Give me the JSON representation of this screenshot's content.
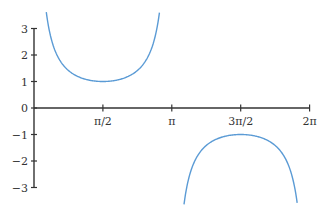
{
  "chart_data": {
    "type": "line",
    "title": "",
    "function": "y = csc(x)",
    "xlabel": "",
    "ylabel": "",
    "xlim": [
      0,
      6.2832
    ],
    "ylim": [
      -3,
      3
    ],
    "grid": false,
    "legend": null,
    "x_ticks": [
      {
        "value": 1.5708,
        "label": "π/2"
      },
      {
        "value": 3.1416,
        "label": "π"
      },
      {
        "value": 4.7124,
        "label": "3π/2"
      },
      {
        "value": 6.2832,
        "label": "2π"
      }
    ],
    "y_ticks": [
      {
        "value": 3,
        "label": "3"
      },
      {
        "value": 2,
        "label": "2"
      },
      {
        "value": 1,
        "label": "1"
      },
      {
        "value": 0,
        "label": "0"
      },
      {
        "value": -1,
        "label": "−1"
      },
      {
        "value": -2,
        "label": "−2"
      },
      {
        "value": -3,
        "label": "−3"
      }
    ],
    "series": [
      {
        "name": "csc(x) branch 1",
        "x_range": [
          0.28,
          2.86
        ],
        "min_point": [
          1.5708,
          1
        ],
        "color": "#5b9bd5"
      },
      {
        "name": "csc(x) branch 2",
        "x_range": [
          3.42,
          6.0
        ],
        "max_point": [
          4.7124,
          -1
        ],
        "color": "#5b9bd5"
      }
    ],
    "axis_color": "#333333"
  }
}
